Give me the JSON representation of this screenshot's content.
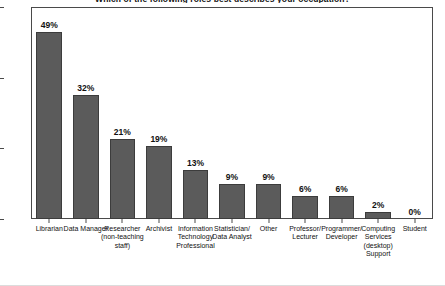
{
  "chart_data": {
    "type": "bar",
    "title": "Which of the following roles best describes your occupation?",
    "xlabel": "",
    "ylabel": "",
    "ylim": [
      0,
      30
    ],
    "yticks": [
      0,
      10,
      20,
      30
    ],
    "ytick_labels": [
      "0",
      "10",
      "20",
      "30"
    ],
    "grid": false,
    "legend": "none",
    "bar_color": "#5b5b5b",
    "bar_edge_color": "#3c3c3c",
    "categories": [
      "Librarian",
      "Data Manager",
      "Researcher (non-teaching staff)",
      "Archivist",
      "Information Technology Professional",
      "Statistician/ Data Analyst",
      "Other",
      "Professor/ Lecturer",
      "Programmer/ Developer",
      "Computing Services (desktop) Support",
      "Student"
    ],
    "values": [
      26.5,
      17.5,
      11.3,
      10.3,
      7.0,
      5.0,
      5.0,
      3.3,
      3.3,
      1.0,
      0.0
    ],
    "data_labels": [
      "49%",
      "32%",
      "21%",
      "19%",
      "13%",
      "9%",
      "9%",
      "6%",
      "6%",
      "2%",
      "0%"
    ],
    "percentages": [
      49,
      32,
      21,
      19,
      13,
      9,
      9,
      6,
      6,
      2,
      0
    ]
  }
}
